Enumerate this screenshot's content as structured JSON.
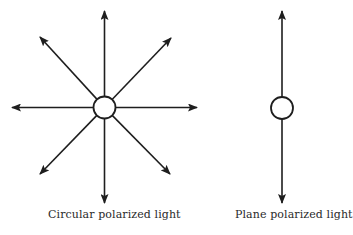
{
  "diagram": {
    "colors": {
      "stroke": "#1e1e1e",
      "background": "#ffffff"
    },
    "left_figure": {
      "caption": "Circular polarized light",
      "center": [
        104.5,
        107.5
      ],
      "circle_radius": 11,
      "arrow_tips": [
        [
          104.5,
          11
        ],
        [
          171,
          38
        ],
        [
          197,
          107.5
        ],
        [
          170,
          174
        ],
        [
          104.5,
          203
        ],
        [
          40,
          174
        ],
        [
          12,
          107.5
        ],
        [
          40,
          37
        ]
      ]
    },
    "right_figure": {
      "caption": "Plane polarized light",
      "center": [
        282,
        108
      ],
      "circle_radius": 11,
      "arrow_tips": [
        [
          282,
          11
        ],
        [
          282,
          203
        ]
      ]
    }
  }
}
